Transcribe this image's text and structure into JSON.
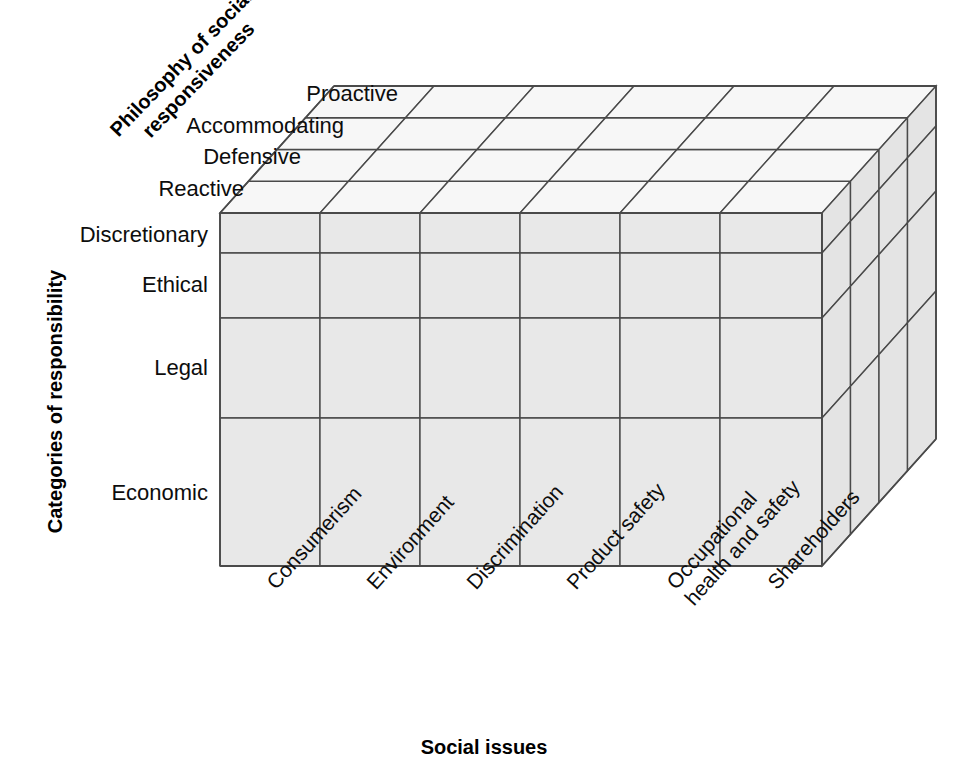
{
  "figure": {
    "type": "three-dimensional-model-of-corporate-social-performance",
    "background_color": "#ffffff",
    "line_color": "#4a4a4a",
    "front_face_color": "#e8e8e8",
    "top_face_color": "#f7f7f7",
    "side_face_color": "#e4e4e4"
  },
  "axes": {
    "depth": {
      "title_line1": "Philosophy of social",
      "title_line2": "responsiveness",
      "labels": [
        "Reactive",
        "Defensive",
        "Accommodating",
        "Proactive"
      ]
    },
    "vertical": {
      "title": "Categories of responsibility",
      "labels": [
        "Discretionary",
        "Ethical",
        "Legal",
        "Economic"
      ]
    },
    "horizontal": {
      "title": "Social issues",
      "labels": [
        "Consumerism",
        "Environment",
        "Discrimination",
        "Product safety",
        "Occupational\nhealth and safety",
        "Shareholders"
      ]
    }
  },
  "geometry": {
    "front_left_x": 220,
    "front_right_x": 822,
    "front_top_y": 213,
    "front_bottom_y": 566,
    "depth_dx": 114,
    "depth_dy": -127,
    "row_boundaries_y": [
      213,
      253,
      318,
      418,
      566
    ],
    "col_boundaries_x": [
      220,
      320,
      420,
      520,
      620,
      720,
      822
    ],
    "depth_steps": 4
  }
}
